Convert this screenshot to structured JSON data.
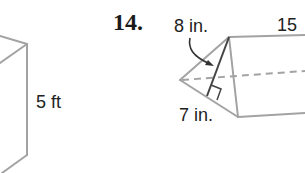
{
  "figure_left": {
    "shape": "rectangular-prism-partial",
    "labels": {
      "height": "5 ft"
    }
  },
  "figure_right": {
    "problem_number": "14.",
    "shape": "triangular-prism",
    "labels": {
      "triangle_height": "8 in.",
      "triangle_base": "7 in.",
      "prism_length": "15"
    },
    "annotations": {
      "right_angle_marker": true,
      "hidden_edge": "dashed",
      "arrow_to_height": true
    }
  },
  "colors": {
    "edge": "#a3a3a3",
    "height_line": "#444444",
    "text": "#222222"
  }
}
